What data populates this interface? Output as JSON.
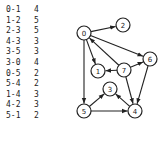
{
  "edge_table": [
    {
      "edge": "0-1",
      "weight": "4"
    },
    {
      "edge": "1-2",
      "weight": "5"
    },
    {
      "edge": "2-3",
      "weight": "5"
    },
    {
      "edge": "4-3",
      "weight": "3"
    },
    {
      "edge": "3-5",
      "weight": "3"
    },
    {
      "edge": "3-0",
      "weight": "4"
    },
    {
      "edge": "0-5",
      "weight": "2"
    },
    {
      "edge": "5-4",
      "weight": "2"
    },
    {
      "edge": "1-4",
      "weight": "3"
    },
    {
      "edge": "4-2",
      "weight": "3"
    },
    {
      "edge": "5-1",
      "weight": "2"
    }
  ],
  "graph": {
    "nodes": [
      "0",
      "1",
      "2",
      "3",
      "4",
      "5",
      "6",
      "7"
    ],
    "directed_edges": [
      {
        "from": "0",
        "to": "2"
      },
      {
        "from": "0",
        "to": "6"
      },
      {
        "from": "0",
        "to": "1"
      },
      {
        "from": "0",
        "to": "5"
      },
      {
        "from": "7",
        "to": "0"
      },
      {
        "from": "7",
        "to": "1"
      },
      {
        "from": "7",
        "to": "6"
      },
      {
        "from": "7",
        "to": "4"
      },
      {
        "from": "6",
        "to": "4"
      },
      {
        "from": "5",
        "to": "3"
      },
      {
        "from": "5",
        "to": "4"
      },
      {
        "from": "4",
        "to": "3"
      }
    ],
    "colors": {
      "stroke": "#222222",
      "fill": "#ffffff"
    }
  }
}
